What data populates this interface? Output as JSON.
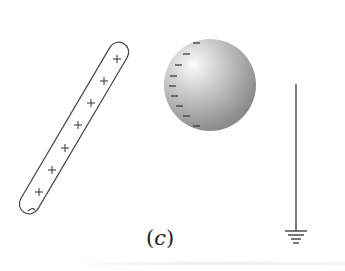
{
  "figure": {
    "label": "(c)",
    "label_parts": {
      "open": "(",
      "letter": "c",
      "close": ")"
    },
    "rod": {
      "description": "positively charged rod",
      "charge_symbol": "+",
      "charge_count": 7,
      "charges": [
        {
          "x": 117,
          "y": 59
        },
        {
          "x": 104,
          "y": 81
        },
        {
          "x": 91,
          "y": 103
        },
        {
          "x": 78,
          "y": 125
        },
        {
          "x": 65,
          "y": 148
        },
        {
          "x": 52,
          "y": 170
        },
        {
          "x": 39,
          "y": 192
        }
      ]
    },
    "sphere": {
      "description": "metal sphere with induced negative charge on near side",
      "charge_symbol": "−",
      "charge_count": 9,
      "center": {
        "x": 210,
        "y": 85
      },
      "radius": 46
    },
    "ground": {
      "description": "ground wire with earth symbol",
      "wire_x": 296,
      "wire_top": 84,
      "wire_bottom": 231
    },
    "colors": {
      "line": "#333333",
      "sphere_light": "#f4f4f4",
      "sphere_dark": "#8a8a8a",
      "background": "#ffffff"
    }
  }
}
